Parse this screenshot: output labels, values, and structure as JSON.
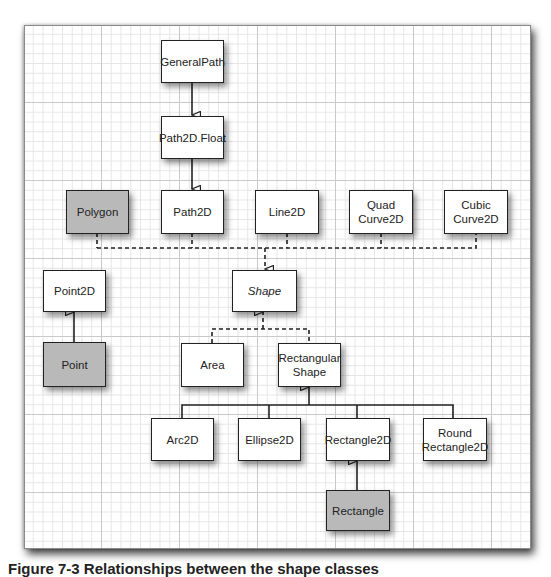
{
  "diagram": {
    "type": "class-hierarchy",
    "nodes": {
      "general_path": {
        "label": "GeneralPath",
        "style": "normal"
      },
      "path2d_float": {
        "label": "Path2D.Float",
        "style": "normal"
      },
      "polygon": {
        "label": "Polygon",
        "style": "gray"
      },
      "path2d": {
        "label": "Path2D",
        "style": "normal"
      },
      "line2d": {
        "label": "Line2D",
        "style": "normal"
      },
      "quad_curve2d": {
        "label": "Quad\nCurve2D",
        "line1": "Quad",
        "line2": "Curve2D",
        "style": "normal"
      },
      "cubic_curve2d": {
        "label": "Cubic\nCurve2D",
        "line1": "Cubic",
        "line2": "Curve2D",
        "style": "normal"
      },
      "point2d": {
        "label": "Point2D",
        "style": "normal"
      },
      "shape": {
        "label": "Shape",
        "style": "italic"
      },
      "point": {
        "label": "Point",
        "style": "gray"
      },
      "area": {
        "label": "Area",
        "style": "normal"
      },
      "rectangular_shape": {
        "label": "Rectangular\nShape",
        "line1": "Rectangular",
        "line2": "Shape",
        "style": "normal"
      },
      "arc2d": {
        "label": "Arc2D",
        "style": "normal"
      },
      "ellipse2d": {
        "label": "Ellipse2D",
        "style": "normal"
      },
      "rectangle2d": {
        "label": "Rectangle2D",
        "style": "normal"
      },
      "round_rectangle2d": {
        "label": "Round\nRectangle2D",
        "line1": "Round",
        "line2": "Rectangle2D",
        "style": "normal"
      },
      "rectangle": {
        "label": "Rectangle",
        "style": "gray"
      }
    },
    "edges": [
      {
        "from": "GeneralPath",
        "to": "Path2D.Float",
        "kind": "extends"
      },
      {
        "from": "Path2D.Float",
        "to": "Path2D",
        "kind": "extends"
      },
      {
        "from": "Polygon",
        "to": "Shape",
        "kind": "implements"
      },
      {
        "from": "Path2D",
        "to": "Shape",
        "kind": "implements"
      },
      {
        "from": "Line2D",
        "to": "Shape",
        "kind": "implements"
      },
      {
        "from": "QuadCurve2D",
        "to": "Shape",
        "kind": "implements"
      },
      {
        "from": "CubicCurve2D",
        "to": "Shape",
        "kind": "implements"
      },
      {
        "from": "Point",
        "to": "Point2D",
        "kind": "extends"
      },
      {
        "from": "Area",
        "to": "Shape",
        "kind": "implements"
      },
      {
        "from": "RectangularShape",
        "to": "Shape",
        "kind": "implements"
      },
      {
        "from": "Arc2D",
        "to": "RectangularShape",
        "kind": "extends"
      },
      {
        "from": "Ellipse2D",
        "to": "RectangularShape",
        "kind": "extends"
      },
      {
        "from": "Rectangle2D",
        "to": "RectangularShape",
        "kind": "extends"
      },
      {
        "from": "RoundRectangle2D",
        "to": "RectangularShape",
        "kind": "extends"
      },
      {
        "from": "Rectangle",
        "to": "Rectangle2D",
        "kind": "extends"
      }
    ],
    "colors": {
      "gray_fill": "#b9b9b9",
      "white_fill": "#ffffff",
      "line": "#222222",
      "grid_major": "#c9c9c9",
      "grid_minor": "#e6e6e6"
    }
  },
  "caption": "Figure 7-3 Relationships between the shape classes"
}
